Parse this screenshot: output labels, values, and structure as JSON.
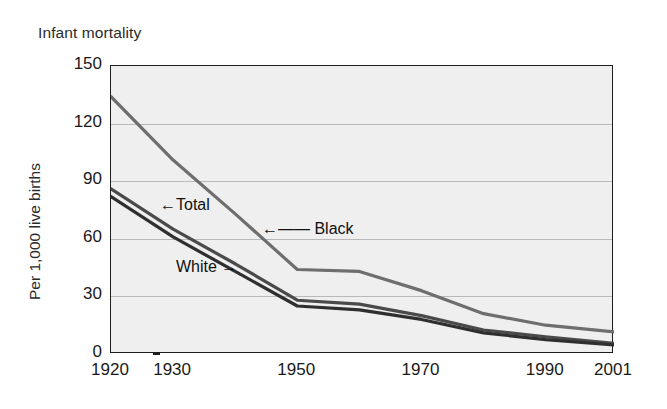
{
  "chart_data": {
    "type": "line",
    "title": "Infant mortality",
    "xlabel": "",
    "ylabel": "Per 1,000 live births",
    "xlim": [
      1920,
      2001
    ],
    "ylim": [
      0,
      150
    ],
    "yticks": [
      0,
      30,
      60,
      90,
      120,
      150
    ],
    "ytick_labels": [
      "0",
      "30",
      "60",
      "90",
      "120",
      "150"
    ],
    "xticks": [
      1920,
      1930,
      1940,
      1950,
      1960,
      1970,
      1980,
      1990,
      2000,
      2001
    ],
    "xtick_labels": [
      "1920",
      "1930",
      "",
      "1950",
      "",
      "1970",
      "",
      "1990",
      "",
      "2001"
    ],
    "grid": "horizontal",
    "legend": "inline-annotations",
    "annotations": [
      {
        "text": "←Total",
        "series": "Total"
      },
      {
        "text": "White →",
        "series": "White"
      },
      {
        "text": "←—— Black",
        "series": "Black"
      }
    ],
    "x": [
      1920,
      1930,
      1940,
      1950,
      1960,
      1970,
      1980,
      1990,
      2001
    ],
    "series": [
      {
        "name": "Black",
        "color": "#6e6e6e",
        "values": [
          134,
          101,
          73,
          44,
          43,
          33,
          21,
          15,
          11.5
        ]
      },
      {
        "name": "Total",
        "color": "#4a4a4a",
        "values": [
          86,
          65,
          47,
          28,
          26,
          20,
          12.5,
          9,
          5.5
        ]
      },
      {
        "name": "White",
        "color": "#2f2f2f",
        "values": [
          82,
          61,
          43,
          25,
          23,
          18,
          11,
          7.5,
          4.7
        ]
      }
    ]
  },
  "axes": {
    "title_text": "Infant mortality",
    "y_axis_title": "Per 1,000 live births"
  },
  "colors": {
    "plot_background": "#efefef",
    "axis": "#1d1d1d",
    "gridline": "#b9b9b9",
    "black_line": "#6e6e6e",
    "total_line": "#4a4a4a",
    "white_line": "#2f2f2f",
    "page_background": "#ffffff"
  }
}
